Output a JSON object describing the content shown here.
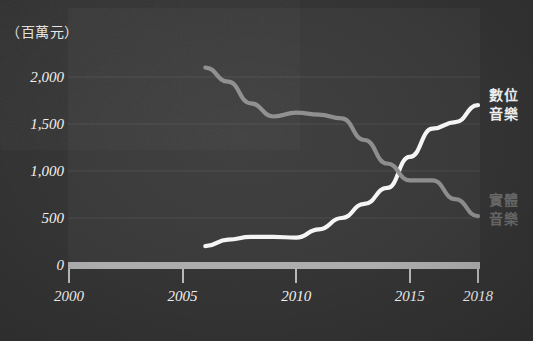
{
  "chart_data": {
    "type": "line",
    "title": "",
    "unit_label": "（百萬元）",
    "xlabel": "",
    "ylabel": "",
    "xlim": [
      2000,
      2018
    ],
    "ylim": [
      0,
      2300
    ],
    "x_ticks": [
      2000,
      2005,
      2010,
      2015,
      2018
    ],
    "x_tick_labels": [
      "2000",
      "2005",
      "2010",
      "2015",
      "2018"
    ],
    "y_ticks": [
      0,
      500,
      1000,
      1500,
      2000
    ],
    "y_tick_labels": [
      "0",
      "500",
      "1,000",
      "1,500",
      "2,000"
    ],
    "grid": true,
    "legend_position": "right",
    "series": [
      {
        "name": "數位音樂",
        "name_line1": "數位",
        "name_line2": "音樂",
        "color": "#f5f5f5",
        "x": [
          2006,
          2007,
          2008,
          2009,
          2010,
          2011,
          2012,
          2013,
          2014,
          2015,
          2016,
          2017,
          2018
        ],
        "values": [
          200,
          270,
          300,
          300,
          290,
          380,
          500,
          650,
          820,
          1150,
          1450,
          1520,
          1700
        ]
      },
      {
        "name": "實體音樂",
        "name_line1": "實體",
        "name_line2": "音樂",
        "color": "#8d8d8d",
        "x": [
          2006,
          2007,
          2008,
          2009,
          2010,
          2011,
          2012,
          2013,
          2014,
          2015,
          2016,
          2017,
          2018
        ],
        "values": [
          2100,
          1950,
          1720,
          1580,
          1620,
          1600,
          1560,
          1330,
          1080,
          900,
          900,
          700,
          520
        ]
      }
    ]
  },
  "axes": {
    "y_labels": [
      "2,000",
      "1,500",
      "1,000",
      "500",
      "0"
    ],
    "x_labels": [
      "2000",
      "2005",
      "2010",
      "2015",
      "2018"
    ]
  },
  "legend": {
    "digital": {
      "line1": "數位",
      "line2": "音樂"
    },
    "physical": {
      "line1": "實體",
      "line2": "音樂"
    }
  },
  "unit": {
    "label": "（百萬元）"
  },
  "colors": {
    "background": "#343434",
    "plot_background": "#3a3a3a",
    "digital_line": "#f5f5f5",
    "physical_line": "#8d8d8d",
    "axis": "#adadad",
    "text": "#f2f2f2"
  }
}
